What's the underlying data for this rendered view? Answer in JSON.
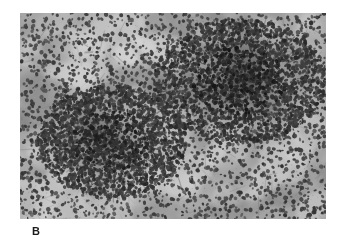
{
  "figure": {
    "panel_label": "B",
    "image_alt": "photomicrograph of tissue section with two dark cellular infiltrate clusters",
    "frame": {
      "x": 20,
      "y": 13,
      "width": 306,
      "height": 206
    },
    "colors": {
      "page_background": "#ffffff",
      "tissue_light": "#cfcfcf",
      "tissue_mid": "#9a9a9a",
      "tissue_dark": "#5a5a5a",
      "nucleus": "#1c1c1c",
      "label_text": "#1a1a1a"
    }
  },
  "chart_data": {
    "type": "heatmap",
    "title": "",
    "xlabel": "",
    "ylabel": "",
    "grid": false,
    "legend": "none",
    "xlim": [
      0,
      306
    ],
    "ylim": [
      0,
      206
    ],
    "regions": [
      {
        "name": "left-cluster",
        "cx": 92,
        "cy": 128,
        "rx": 74,
        "ry": 56,
        "core_rx": 42,
        "core_ry": 30,
        "density": 0.93,
        "darkness": 0.82,
        "label": "dense cellular aggregate (lower left)"
      },
      {
        "name": "right-cluster",
        "cx": 220,
        "cy": 68,
        "rx": 86,
        "ry": 62,
        "core_rx": 54,
        "core_ry": 36,
        "density": 1.0,
        "darkness": 0.95,
        "label": "dense cellular aggregate (upper right)"
      }
    ],
    "background_field": {
      "nucleus_count": 2600,
      "cluster_nucleus_count": 2100,
      "nucleus_radius_min": 1.1,
      "nucleus_radius_max": 2.4,
      "mottle_blob_count": 240,
      "base_gray": "#a6a6a6"
    },
    "pale_patches": [
      {
        "cx": 150,
        "cy": 38,
        "rx": 26,
        "ry": 16
      },
      {
        "cx": 196,
        "cy": 22,
        "rx": 22,
        "ry": 13
      },
      {
        "cx": 118,
        "cy": 96,
        "rx": 24,
        "ry": 15
      },
      {
        "cx": 58,
        "cy": 60,
        "rx": 20,
        "ry": 13
      },
      {
        "cx": 262,
        "cy": 150,
        "rx": 26,
        "ry": 17
      },
      {
        "cx": 168,
        "cy": 158,
        "rx": 28,
        "ry": 17
      },
      {
        "cx": 30,
        "cy": 176,
        "rx": 22,
        "ry": 14
      },
      {
        "cx": 292,
        "cy": 196,
        "rx": 20,
        "ry": 13
      },
      {
        "cx": 206,
        "cy": 120,
        "rx": 20,
        "ry": 12
      },
      {
        "cx": 100,
        "cy": 196,
        "rx": 24,
        "ry": 13
      }
    ]
  }
}
